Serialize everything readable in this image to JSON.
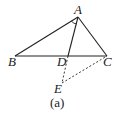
{
  "figure": {
    "caption": "(a)",
    "points": {
      "A": {
        "label": "A",
        "x": 78,
        "y": 17
      },
      "B": {
        "label": "B",
        "x": 15,
        "y": 56
      },
      "C": {
        "label": "C",
        "x": 107,
        "y": 56
      },
      "D": {
        "label": "D",
        "x": 68,
        "y": 56
      },
      "E": {
        "label": "E",
        "x": 62,
        "y": 83
      }
    },
    "segments": [
      {
        "from": "A",
        "to": "B",
        "style": "solid"
      },
      {
        "from": "A",
        "to": "C",
        "style": "solid"
      },
      {
        "from": "B",
        "to": "C",
        "style": "solid"
      },
      {
        "from": "A",
        "to": "D",
        "style": "solid"
      },
      {
        "from": "D",
        "to": "E",
        "style": "dashed"
      },
      {
        "from": "E",
        "to": "C",
        "style": "dashed"
      }
    ],
    "angle_marks": [
      {
        "vertex": "A",
        "between": [
          "B",
          "D"
        ]
      }
    ],
    "colors": {
      "stroke": "#222222",
      "background": "#ffffff"
    }
  }
}
